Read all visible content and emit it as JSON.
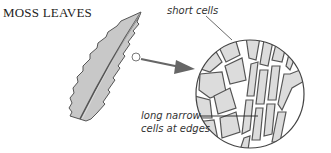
{
  "title": "MOSS LEAVES",
  "labels": {
    "short_cells": "short cells",
    "long_cells_line1": "long narrow",
    "long_cells_line2": "cells at edges"
  },
  "colors": {
    "leaf_fill": "#c8c8c8",
    "outline": "#555555",
    "cell_fill": "#dcdcdc",
    "arrow": "#666666"
  }
}
